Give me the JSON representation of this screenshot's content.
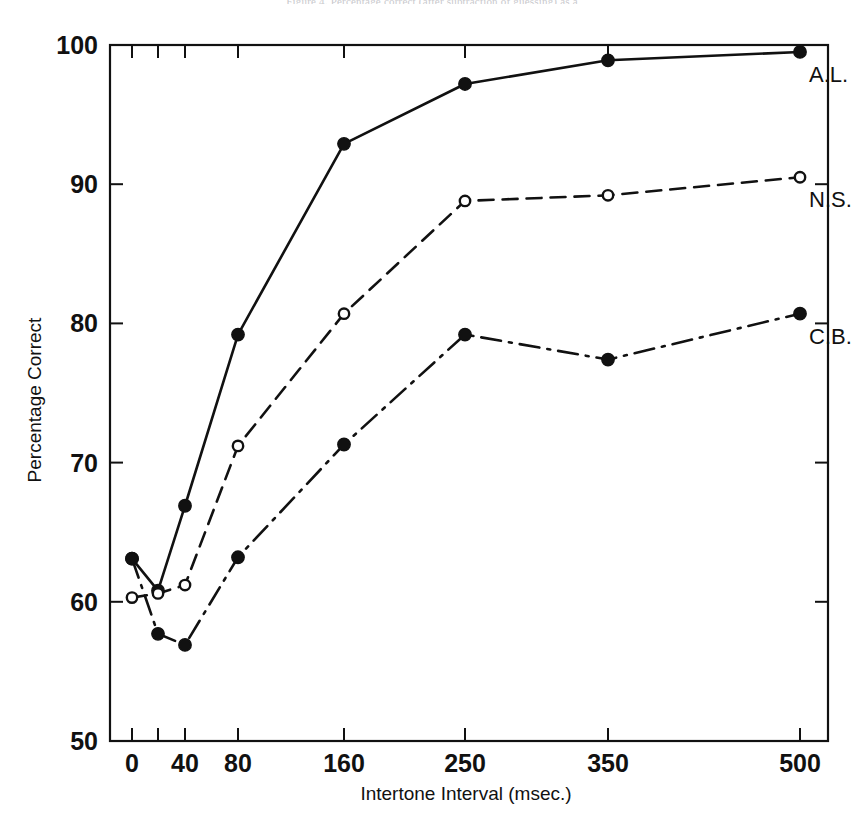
{
  "figure": {
    "top_caption": "Figure 4. Percentage correct (after subtraction of guessing) as a",
    "background": "#ffffff",
    "ink_color": "#111111"
  },
  "chart_data": {
    "type": "line",
    "title": "",
    "subtitle": "",
    "xlabel": "Intertone Interval (msec.)",
    "ylabel": "Percentage Correct",
    "x": [
      0,
      20,
      40,
      80,
      160,
      250,
      350,
      500
    ],
    "x_tick_labels": [
      "0",
      "",
      "40",
      "80",
      "160",
      "250",
      "350",
      "500"
    ],
    "x_tick_positions_px": [
      132,
      158,
      185,
      238,
      344,
      465,
      608,
      800
    ],
    "y_ticks": [
      50,
      60,
      70,
      80,
      90,
      100
    ],
    "y_tick_labels": [
      "50",
      "60",
      "70",
      "80",
      "90",
      "100"
    ],
    "ylim": [
      50,
      100
    ],
    "xlim_px": [
      110,
      828
    ],
    "grid": false,
    "legend": "inline-right-of-last-point",
    "frame": "box-all-four-sides-inward-ticks",
    "series": [
      {
        "name": "A.L.",
        "label": "A.L.",
        "linestyle": "solid",
        "marker": "filled-circle",
        "color": "#111111",
        "values": [
          63.1,
          60.8,
          66.9,
          79.2,
          92.9,
          97.2,
          98.9,
          99.5
        ]
      },
      {
        "name": "N.S.",
        "label": "N.S.",
        "linestyle": "dashed",
        "marker": "open-circle",
        "color": "#111111",
        "values": [
          60.3,
          60.6,
          61.2,
          71.2,
          80.7,
          88.8,
          89.2,
          90.5
        ]
      },
      {
        "name": "C.B.",
        "label": "C.B.",
        "linestyle": "dash-dot",
        "marker": "filled-circle",
        "color": "#111111",
        "values": [
          63.1,
          57.7,
          56.9,
          63.2,
          71.3,
          79.2,
          77.4,
          80.7
        ]
      }
    ]
  }
}
